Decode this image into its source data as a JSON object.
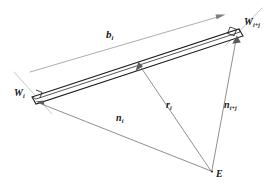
{
  "figure": {
    "type": "vector-geometry-diagram",
    "background_color": "#ffffff",
    "line_color": "#1d1d1d",
    "vector_color": "#6a6a6a",
    "width": 272,
    "height": 187
  },
  "labels": {
    "b_vector": {
      "symbol": "b",
      "subscript": "i"
    },
    "w_start": {
      "symbol": "W",
      "subscript": "i"
    },
    "w_end": {
      "symbol": "W",
      "subscript": "i+j"
    },
    "r_vector": {
      "symbol": "r",
      "subscript": "i"
    },
    "n_start": {
      "symbol": "n",
      "subscript": "i"
    },
    "n_end": {
      "symbol": "n",
      "subscript": "i+j"
    },
    "origin_point": {
      "symbol": "E",
      "subscript": ""
    }
  },
  "geometry": {
    "points": {
      "W_i": [
        32,
        97
      ],
      "W_ij": [
        240,
        29
      ],
      "E": [
        212,
        172
      ],
      "r_tip": [
        139,
        62
      ],
      "b_tail": [
        30,
        72
      ],
      "b_head": [
        224,
        15
      ]
    },
    "beam": {
      "shape": "elongated parallelogram",
      "length_px": 219,
      "thickness_px": 13
    },
    "vectors": [
      {
        "name": "b_i",
        "from": "W_i",
        "to": "W_ij",
        "arrow": true,
        "style": "thin-parallel-offset"
      },
      {
        "name": "n_i",
        "from": "E",
        "to": "W_i",
        "arrow": true
      },
      {
        "name": "r_i",
        "from": "E",
        "to": "beam-midpoint",
        "arrow": true
      },
      {
        "name": "n_i+j",
        "from": "E",
        "to": "W_ij",
        "arrow": true
      }
    ],
    "right_angle_marks": [
      "W_i",
      "W_ij"
    ]
  }
}
